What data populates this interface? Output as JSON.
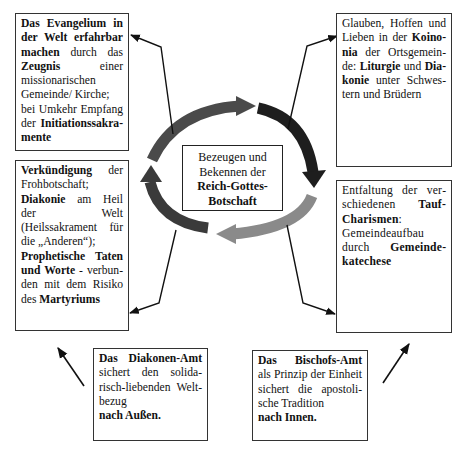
{
  "center": {
    "lines": [
      "Bezeugen und",
      "Bekennen der"
    ],
    "bold_lines": [
      "Reich-Gottes-",
      "Botschaft"
    ]
  },
  "boxes": {
    "top_left": {
      "segments": [
        {
          "t": "Das Evangelium in der Welt erfahrbar machen",
          "b": true
        },
        {
          "t": " durch das ",
          "b": false
        },
        {
          "t": "Zeugnis",
          "b": true
        },
        {
          "t": " einer missio­narischen Gemeinde/ Kirche;",
          "b": false
        },
        {
          "t": "bei Umkehr Empfang der ",
          "b": false,
          "br": true
        },
        {
          "t": "Initiationssakra­mente",
          "b": true
        }
      ]
    },
    "top_right": {
      "segments": [
        {
          "t": "Glauben, Hoffen und Lieben in der ",
          "b": false
        },
        {
          "t": "Koino­nia",
          "b": true
        },
        {
          "t": " der Ortsgemein­de: ",
          "b": false
        },
        {
          "t": "Liturgie",
          "b": true
        },
        {
          "t": " und ",
          "b": false
        },
        {
          "t": "Dia­konie",
          "b": true
        },
        {
          "t": " unter Schwes­tern und Brüdern",
          "b": false
        }
      ]
    },
    "mid_left": {
      "segments": [
        {
          "t": "Verkündigung",
          "b": true
        },
        {
          "t": " der Frohbotschaft;",
          "b": false
        },
        {
          "t": "Diakonie",
          "b": true,
          "br": true
        },
        {
          "t": " am Heil der Welt (Heilssakrament für die „Anderen“);",
          "b": false
        },
        {
          "t": "Prophetische Taten und Worte",
          "b": true,
          "br": true
        },
        {
          "t": " - verbun­den mit dem Risiko des ",
          "b": false
        },
        {
          "t": "Martyriums",
          "b": true
        }
      ]
    },
    "mid_right": {
      "segments": [
        {
          "t": "Entfaltung der ver­schiedenen ",
          "b": false
        },
        {
          "t": "Tauf-Charismen",
          "b": true
        },
        {
          "t": ": Gemeindeaufbau durch ",
          "b": false
        },
        {
          "t": "Gemeinde­katechese",
          "b": true
        }
      ]
    },
    "bottom_left": {
      "segments": [
        {
          "t": "Das Diakonen-Amt",
          "b": true
        },
        {
          "t": " sichert den solida­risch-liebenden Welt­bezug",
          "b": false
        },
        {
          "t": "nach Außen.",
          "b": true,
          "br": true
        }
      ]
    },
    "bottom_right": {
      "segments": [
        {
          "t": "Das Bischofs-Amt",
          "b": true
        },
        {
          "t": " als Prinzip der Einheit sichert die apostoli­sche Tradition",
          "b": false
        },
        {
          "t": "nach Innen.",
          "b": true,
          "br": true
        }
      ]
    }
  },
  "colors": {
    "arrow_top": "#4a4a4a",
    "arrow_right": "#1e1e1e",
    "arrow_bottom": "#8a8a8a",
    "arrow_left": "#3a3a3a",
    "line": "#111111",
    "border": "#333333"
  }
}
